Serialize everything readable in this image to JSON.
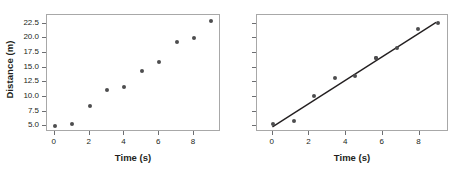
{
  "figure": {
    "background": "#ffffff",
    "marker_color": "#4d4d4f",
    "line_color": "#231f20",
    "frame_color": "#a8a8a8",
    "tick_color": "#6d6e71",
    "text_color": "#231f20"
  },
  "chart_data": [
    {
      "type": "scatter",
      "panel": "left",
      "title": "",
      "xlabel": "Time (s)",
      "ylabel": "Distance (m)",
      "xlim": [
        -0.45,
        9.55
      ],
      "ylim": [
        4.0,
        24.0
      ],
      "xticks": [
        0,
        2,
        4,
        6,
        8
      ],
      "xtick_labels": [
        "0",
        "2",
        "4",
        "6",
        "8"
      ],
      "yticks": [
        5.0,
        7.5,
        10.0,
        12.5,
        15.0,
        17.5,
        20.0,
        22.5
      ],
      "ytick_labels": [
        "5.0",
        "7.5",
        "10.0",
        "12.5",
        "15.0",
        "17.5",
        "20.0",
        "22.5"
      ],
      "grid": false,
      "legend": "none",
      "x": [
        0,
        1,
        2,
        3,
        4,
        5,
        6,
        7,
        8,
        9
      ],
      "y": [
        5.1,
        5.4,
        8.4,
        11.1,
        11.7,
        14.4,
        16.0,
        19.4,
        20.1,
        23.0
      ]
    },
    {
      "type": "scatter",
      "panel": "right",
      "title": "",
      "xlabel": "Time (s)",
      "ylabel": "",
      "xlim": [
        -0.85,
        9.6
      ],
      "ylim": [
        4.0,
        24.0
      ],
      "xticks": [
        0,
        2,
        4,
        6,
        8
      ],
      "xtick_labels": [
        "0",
        "2",
        "4",
        "6",
        "8"
      ],
      "yticks": [
        5.0,
        7.5,
        10.0,
        12.5,
        15.0,
        17.5,
        20.0,
        22.5
      ],
      "ytick_labels": [
        "",
        "",
        "",
        "",
        "",
        "",
        "",
        ""
      ],
      "grid": false,
      "legend": "none",
      "x": [
        0.0,
        1.15,
        2.25,
        3.4,
        4.5,
        5.65,
        6.75,
        7.9,
        9.0,
        5.65
      ],
      "y": [
        5.3,
        5.9,
        10.2,
        13.2,
        13.5,
        16.6,
        18.4,
        21.6,
        22.6,
        16.6
      ],
      "fit_line": {
        "type": "line",
        "slope": 2.02,
        "intercept": 4.55,
        "x_start": 0.0,
        "x_end": 9.0,
        "y_start": 4.55,
        "y_end": 22.73
      }
    }
  ]
}
